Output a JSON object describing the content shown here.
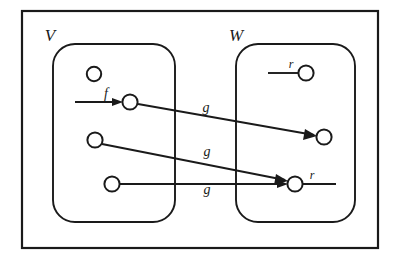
{
  "figure": {
    "kind": "set-mapping-diagram",
    "background_color": "#ffffff",
    "ink_color": "#1a1a1a",
    "width": 402,
    "height": 265
  },
  "frame": {
    "name": "outer-frame",
    "x": 22,
    "y": 11,
    "width": 356,
    "height": 237
  },
  "sets": [
    {
      "id": "V",
      "label": "V",
      "label_x": 50,
      "label_y": 41,
      "box_x": 53,
      "box_y": 44,
      "box_width": 122,
      "box_height": 178,
      "corner_radius": 22
    },
    {
      "id": "W",
      "label": "W",
      "label_x": 234,
      "label_y": 41,
      "box_x": 236,
      "box_y": 44,
      "box_width": 119,
      "box_height": 178,
      "corner_radius": 22
    }
  ],
  "nodes": [
    {
      "id": "v-top-isolated",
      "set": "V",
      "cx": 94,
      "cy": 74,
      "r": 7.2
    },
    {
      "id": "v-f-target",
      "set": "V",
      "cx": 130,
      "cy": 102,
      "r": 7.6
    },
    {
      "id": "v-middle",
      "set": "V",
      "cx": 95,
      "cy": 140,
      "r": 7.6
    },
    {
      "id": "v-bottom",
      "set": "V",
      "cx": 112,
      "cy": 184,
      "r": 7.6
    },
    {
      "id": "w-top-r",
      "set": "W",
      "cx": 306,
      "cy": 73,
      "r": 7.6
    },
    {
      "id": "w-upper-target",
      "set": "W",
      "cx": 324,
      "cy": 137,
      "r": 7.6
    },
    {
      "id": "w-lower-r",
      "set": "W",
      "cx": 295,
      "cy": 184,
      "r": 7.6
    }
  ],
  "edges": [
    {
      "id": "edge-f",
      "label": "f",
      "label_x": 106,
      "label_y": 97,
      "x1": 75,
      "y1": 102,
      "x2": 122,
      "y2": 102,
      "arrow": "end"
    },
    {
      "id": "edge-g-upper",
      "label": "g",
      "label_x": 206,
      "label_y": 110,
      "x1": 138,
      "y1": 104,
      "x2": 316,
      "y2": 136,
      "arrow": "end"
    },
    {
      "id": "edge-g-middle",
      "label": "g",
      "label_x": 207,
      "label_y": 154,
      "x1": 102,
      "y1": 144,
      "x2": 287,
      "y2": 181,
      "arrow": "end"
    },
    {
      "id": "edge-g-lower",
      "label": "g",
      "label_x": 207,
      "label_y": 192,
      "x1": 120,
      "y1": 184,
      "x2": 287,
      "y2": 184,
      "arrow": "end"
    },
    {
      "id": "edge-r-top",
      "label": "r",
      "label_x": 291,
      "label_y": 68,
      "x1": 268,
      "y1": 73,
      "x2": 299,
      "y2": 73,
      "arrow": "none"
    },
    {
      "id": "edge-r-lower",
      "label": "r",
      "label_x": 311,
      "label_y": 179,
      "x1": 303,
      "y1": 184,
      "x2": 336,
      "y2": 184,
      "arrow": "none"
    }
  ],
  "labels": {
    "set_v": "V",
    "set_w": "W",
    "map_f": "f",
    "map_g_1": "g",
    "map_g_2": "g",
    "map_g_3": "g",
    "elem_r_1": "r",
    "elem_r_2": "r"
  }
}
